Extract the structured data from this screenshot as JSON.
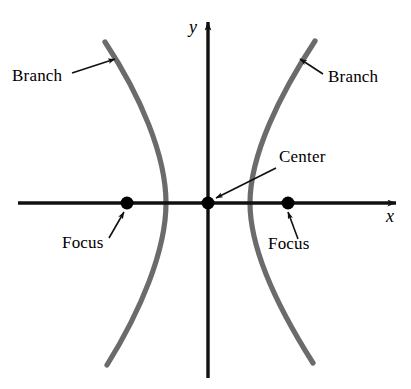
{
  "figure": {
    "background_color": "#ffffff",
    "axis_color": "#111111",
    "curve_color": "#6b6b6b",
    "point_color": "#000000",
    "leader_color": "#111111",
    "width": 411,
    "height": 389
  },
  "axes": {
    "x": {
      "label": "x",
      "label_position": {
        "x": 390,
        "y": 222
      },
      "line": {
        "x1": 18,
        "y1": 203,
        "x2": 396,
        "y2": 203
      },
      "arrow": "right"
    },
    "y": {
      "label": "y",
      "label_position": {
        "x": 193,
        "y": 33
      },
      "line": {
        "x1": 208,
        "y1": 378,
        "x2": 208,
        "y2": 22
      },
      "arrow": "up"
    }
  },
  "points": [
    {
      "name": "left-focus",
      "label": "Focus",
      "cx": 127,
      "cy": 203,
      "r": 6.5
    },
    {
      "name": "center",
      "label": "Center",
      "cx": 208,
      "cy": 203,
      "r": 6.5
    },
    {
      "name": "right-focus",
      "label": "Focus",
      "cx": 288,
      "cy": 203,
      "r": 6.5
    }
  ],
  "curves": [
    {
      "name": "left-branch",
      "label": "Branch",
      "path": "M 105 42 C 140 95, 166 155, 166 203 C 166 251, 140 312, 107 365"
    },
    {
      "name": "right-branch",
      "label": "Branch",
      "path": "M 315 41 C 280 94, 250 155, 250 203 C 250 251, 280 311, 313 363"
    }
  ],
  "annotations": [
    {
      "name": "branch-left",
      "text": "Branch",
      "text_x": 12,
      "text_y": 81,
      "anchor": "start",
      "leader": {
        "x1": 72,
        "y1": 73,
        "x2": 115,
        "y2": 59
      }
    },
    {
      "name": "branch-right",
      "text": "Branch",
      "text_x": 328,
      "text_y": 82,
      "anchor": "start",
      "leader": {
        "x1": 323,
        "y1": 74,
        "x2": 300,
        "y2": 59
      }
    },
    {
      "name": "center",
      "text": "Center",
      "text_x": 279,
      "text_y": 162,
      "anchor": "start",
      "leader": {
        "x1": 276,
        "y1": 168,
        "x2": 216,
        "y2": 198
      }
    },
    {
      "name": "focus-left",
      "text": "Focus",
      "text_x": 62,
      "text_y": 248,
      "anchor": "start",
      "leader": {
        "x1": 109,
        "y1": 238,
        "x2": 124,
        "y2": 212
      }
    },
    {
      "name": "focus-right",
      "text": "Focus",
      "text_x": 268,
      "text_y": 249,
      "anchor": "start",
      "leader": {
        "x1": 298,
        "y1": 239,
        "x2": 288,
        "y2": 212
      }
    }
  ],
  "chart_data": {
    "type": "line",
    "xlabel": "x",
    "ylabel": "y",
    "grid": false,
    "legend": "none",
    "annotations": [
      "Branch",
      "Branch",
      "Center",
      "Focus",
      "Focus"
    ],
    "series": [
      {
        "name": "left-branch",
        "points": [
          [
            105,
            42
          ],
          [
            166,
            203
          ],
          [
            107,
            365
          ]
        ]
      },
      {
        "name": "right-branch",
        "points": [
          [
            315,
            41
          ],
          [
            250,
            203
          ],
          [
            313,
            363
          ]
        ]
      }
    ],
    "markers": [
      {
        "name": "left-focus",
        "x": 127,
        "y": 203
      },
      {
        "name": "center",
        "x": 208,
        "y": 203
      },
      {
        "name": "right-focus",
        "x": 288,
        "y": 203
      }
    ]
  }
}
